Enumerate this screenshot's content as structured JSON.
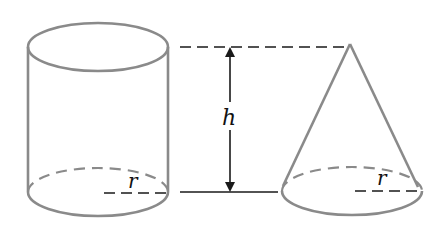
{
  "figure": {
    "labels": {
      "height": "h",
      "cylinder_radius": "r",
      "cone_radius": "r"
    },
    "colors": {
      "solid_outline": "#8a8a8a",
      "guide_lines": "#1a1a1a",
      "background": "#ffffff"
    },
    "shapes": [
      {
        "name": "cylinder",
        "label_radius": "r"
      },
      {
        "name": "cone",
        "label_radius": "r"
      }
    ]
  }
}
